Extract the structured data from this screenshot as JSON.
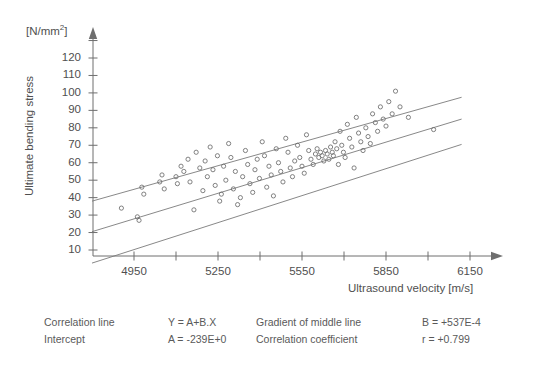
{
  "figure": {
    "unit_label_html": "[N/mm<sup>2</sup>]",
    "unit_label": "[N/mm2]",
    "y_axis_title": "Ultimate bending stress",
    "x_axis_title": "Ultrasound velocity [m/s]"
  },
  "caption": {
    "row1": {
      "label_left": "Correlation line",
      "value_left": "Y = A+B.X",
      "label_right": "Gradient of middle line",
      "value_right": "B = +537E-4"
    },
    "row2": {
      "label_left": "Intercept",
      "value_left": "A = -239E+0",
      "label_right": "Correlation coefficient",
      "value_right": "r =  +0.799"
    }
  },
  "chart_data": {
    "type": "scatter",
    "title": "",
    "xlabel": "Ultrasound velocity [m/s]",
    "ylabel": "Ultimate bending stress",
    "yunit": "[N/mm2]",
    "xlim": [
      4800,
      6300
    ],
    "ylim": [
      0,
      128
    ],
    "grid": false,
    "legend": null,
    "x_ticks_major": [
      4950,
      5250,
      5550,
      5850,
      6150
    ],
    "x_ticks_minor": [
      5100,
      5400,
      5700,
      6000
    ],
    "x_tick_labels": [
      "4950",
      "5250",
      "5550",
      "5850",
      "6150"
    ],
    "y_ticks": [
      10,
      20,
      30,
      40,
      50,
      60,
      70,
      80,
      90,
      100,
      110,
      120
    ],
    "y_tick_labels": [
      "10",
      "20",
      "30",
      "40",
      "50",
      "60",
      "70",
      "80",
      "90",
      "100",
      "110",
      "120"
    ],
    "marker": "open-circle",
    "regression": {
      "equation": "Y = A+B.X",
      "intercept": -239.0,
      "intercept_text": "A = -239E+0",
      "gradient": 0.0537,
      "gradient_text": "B = +537E-4",
      "correlation": 0.799,
      "correlation_text": "r =  +0.799"
    },
    "lines": [
      {
        "name": "upper confidence line",
        "x": [
          4800,
          6120
        ],
        "y": [
          38.0,
          97.5
        ]
      },
      {
        "name": "middle correlation line",
        "x": [
          4800,
          6120
        ],
        "y": [
          20.5,
          85.0
        ]
      },
      {
        "name": "lower confidence line",
        "x": [
          4800,
          6120
        ],
        "y": [
          2.5,
          70.5
        ]
      }
    ],
    "points": [
      [
        4905,
        34
      ],
      [
        4978,
        46
      ],
      [
        4985,
        42
      ],
      [
        4962,
        29
      ],
      [
        4968,
        27
      ],
      [
        5042,
        49
      ],
      [
        5050,
        53
      ],
      [
        5058,
        45
      ],
      [
        5100,
        52
      ],
      [
        5105,
        48
      ],
      [
        5118,
        58
      ],
      [
        5128,
        55
      ],
      [
        5143,
        62
      ],
      [
        5150,
        49
      ],
      [
        5164,
        33
      ],
      [
        5172,
        66
      ],
      [
        5185,
        57
      ],
      [
        5196,
        44
      ],
      [
        5204,
        61
      ],
      [
        5212,
        52
      ],
      [
        5222,
        69
      ],
      [
        5232,
        56
      ],
      [
        5240,
        47
      ],
      [
        5248,
        64
      ],
      [
        5256,
        38
      ],
      [
        5262,
        42
      ],
      [
        5270,
        58
      ],
      [
        5278,
        50
      ],
      [
        5288,
        71
      ],
      [
        5296,
        63
      ],
      [
        5305,
        45
      ],
      [
        5312,
        55
      ],
      [
        5320,
        36
      ],
      [
        5330,
        40
      ],
      [
        5338,
        52
      ],
      [
        5348,
        67
      ],
      [
        5356,
        59
      ],
      [
        5364,
        48
      ],
      [
        5374,
        43
      ],
      [
        5382,
        56
      ],
      [
        5390,
        62
      ],
      [
        5398,
        51
      ],
      [
        5408,
        72
      ],
      [
        5416,
        64
      ],
      [
        5424,
        46
      ],
      [
        5432,
        58
      ],
      [
        5440,
        53
      ],
      [
        5448,
        41
      ],
      [
        5458,
        68
      ],
      [
        5466,
        60
      ],
      [
        5474,
        55
      ],
      [
        5482,
        49
      ],
      [
        5492,
        74
      ],
      [
        5500,
        66
      ],
      [
        5508,
        57
      ],
      [
        5516,
        52
      ],
      [
        5524,
        61
      ],
      [
        5534,
        70
      ],
      [
        5542,
        63
      ],
      [
        5550,
        58
      ],
      [
        5558,
        54
      ],
      [
        5566,
        76
      ],
      [
        5574,
        67
      ],
      [
        5582,
        62
      ],
      [
        5590,
        59
      ],
      [
        5598,
        65
      ],
      [
        5604,
        68
      ],
      [
        5610,
        63
      ],
      [
        5616,
        66
      ],
      [
        5622,
        64
      ],
      [
        5628,
        61
      ],
      [
        5634,
        67
      ],
      [
        5640,
        65
      ],
      [
        5646,
        62
      ],
      [
        5652,
        69
      ],
      [
        5658,
        66
      ],
      [
        5662,
        64
      ],
      [
        5668,
        72
      ],
      [
        5674,
        68
      ],
      [
        5680,
        59
      ],
      [
        5686,
        78
      ],
      [
        5692,
        70
      ],
      [
        5698,
        66
      ],
      [
        5704,
        63
      ],
      [
        5712,
        82
      ],
      [
        5720,
        74
      ],
      [
        5728,
        69
      ],
      [
        5736,
        57
      ],
      [
        5744,
        86
      ],
      [
        5752,
        77
      ],
      [
        5760,
        72
      ],
      [
        5768,
        67
      ],
      [
        5778,
        80
      ],
      [
        5786,
        75
      ],
      [
        5794,
        71
      ],
      [
        5802,
        88
      ],
      [
        5812,
        83
      ],
      [
        5820,
        78
      ],
      [
        5830,
        92
      ],
      [
        5840,
        85
      ],
      [
        5850,
        81
      ],
      [
        5860,
        95
      ],
      [
        5872,
        88
      ],
      [
        5884,
        101
      ],
      [
        5900,
        92
      ],
      [
        5930,
        86
      ],
      [
        6020,
        79
      ]
    ]
  }
}
